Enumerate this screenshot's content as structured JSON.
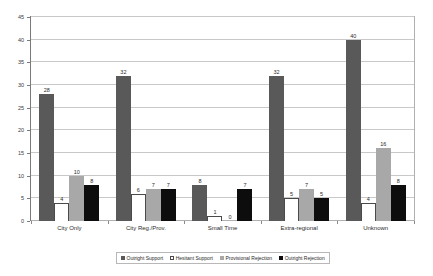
{
  "chart_data": {
    "type": "bar",
    "title": "",
    "xlabel": "",
    "ylabel": "",
    "ylim": [
      0,
      45
    ],
    "yticks": [
      0,
      5,
      10,
      15,
      20,
      25,
      30,
      35,
      40,
      45
    ],
    "grid": true,
    "legend_position": "bottom-center",
    "categories": [
      "City Only",
      "City Reg./Prov.",
      "Small Time",
      "Extra-regional",
      "Unknown"
    ],
    "series": [
      {
        "name": "Outright Support",
        "color": "#595959",
        "values": [
          28,
          32,
          8,
          32,
          40
        ]
      },
      {
        "name": "Hesitant Support",
        "color": "#ffffff",
        "values": [
          4,
          6,
          1,
          5,
          4
        ]
      },
      {
        "name": "Provisional Rejection",
        "color": "#a8a8a8",
        "values": [
          10,
          7,
          0,
          7,
          16
        ]
      },
      {
        "name": "Outright Rejection",
        "color": "#0d0d0d",
        "values": [
          8,
          7,
          7,
          5,
          8
        ]
      }
    ]
  }
}
